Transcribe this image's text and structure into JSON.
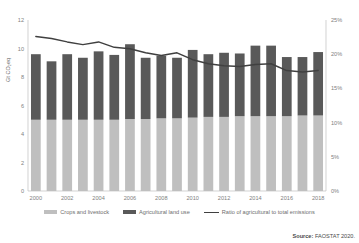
{
  "chart_data": {
    "type": "bar",
    "title": "",
    "subtitle": "",
    "xlabel": "",
    "ylabel": "Gt CO₂eq",
    "y2label": "",
    "ylim": [
      0,
      12
    ],
    "y2lim": [
      0,
      25
    ],
    "yticks": [
      "0",
      "2",
      "4",
      "6",
      "8",
      "10",
      "12"
    ],
    "y2ticks": [
      "0%",
      "5%",
      "10%",
      "15%",
      "20%",
      "25%"
    ],
    "grid": false,
    "legend_position": "bottom",
    "stacked": true,
    "categories": [
      "2000",
      "2001",
      "2002",
      "2003",
      "2004",
      "2005",
      "2006",
      "2007",
      "2008",
      "2009",
      "2010",
      "2011",
      "2012",
      "2013",
      "2014",
      "2015",
      "2016",
      "2017",
      "2018"
    ],
    "xtick_labels": [
      "2000",
      "2002",
      "2004",
      "2006",
      "2008",
      "2010",
      "2012",
      "2014",
      "2016",
      "2018"
    ],
    "series": [
      {
        "name": "Crops and livestock",
        "color": "#bfbfbf",
        "axis": "left",
        "values": [
          5.0,
          5.0,
          5.0,
          5.0,
          5.0,
          5.0,
          5.05,
          5.05,
          5.1,
          5.1,
          5.15,
          5.2,
          5.2,
          5.25,
          5.25,
          5.25,
          5.25,
          5.3,
          5.3
        ]
      },
      {
        "name": "Agricultural land use",
        "color": "#595959",
        "axis": "left",
        "values": [
          4.6,
          4.1,
          4.6,
          4.35,
          4.8,
          4.55,
          5.25,
          4.3,
          4.4,
          4.25,
          4.75,
          4.4,
          4.5,
          4.4,
          4.95,
          4.95,
          4.15,
          4.1,
          4.45
        ]
      },
      {
        "name": "Ratio of agricultural to total emissions",
        "color": "#404040",
        "axis": "right",
        "type": "line",
        "values": [
          22.6,
          22.3,
          21.8,
          21.4,
          21.8,
          21.0,
          20.8,
          20.2,
          19.8,
          20.2,
          19.2,
          18.6,
          18.3,
          18.2,
          18.5,
          18.6,
          17.6,
          17.4,
          17.6
        ]
      }
    ],
    "legend": [
      {
        "label": "Crops and livestock",
        "type": "swatch",
        "color": "#bfbfbf"
      },
      {
        "label": "Agricultural land use",
        "type": "swatch",
        "color": "#595959"
      },
      {
        "label": "Ratio of agricultural to total emissions",
        "type": "line",
        "color": "#404040"
      }
    ],
    "source_prefix": "Source:",
    "source_text": "FAOSTAT 2020."
  }
}
